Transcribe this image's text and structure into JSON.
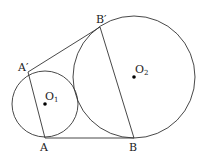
{
  "diagram": {
    "circles": [
      {
        "name": "O1",
        "cx": 45,
        "cy": 104,
        "r": 33
      },
      {
        "name": "O2",
        "cx": 134,
        "cy": 77,
        "r": 61
      }
    ],
    "segments": [
      {
        "name": "AB",
        "x1": 45,
        "y1": 138,
        "x2": 134,
        "y2": 138
      },
      {
        "name": "A'B'",
        "x1": 28,
        "y1": 72,
        "x2": 100,
        "y2": 27
      },
      {
        "name": "AA'",
        "x1": 45,
        "y1": 138,
        "x2": 28,
        "y2": 72
      },
      {
        "name": "BB'",
        "x1": 134,
        "y1": 138,
        "x2": 100,
        "y2": 27
      }
    ],
    "labels": {
      "A": "A",
      "B": "B",
      "A_prime": "A′",
      "B_prime": "B′",
      "O1_main": "O",
      "O1_sub": "1",
      "O2_main": "O",
      "O2_sub": "2"
    },
    "colors": {
      "stroke": "#333333",
      "dot": "#000000"
    }
  }
}
